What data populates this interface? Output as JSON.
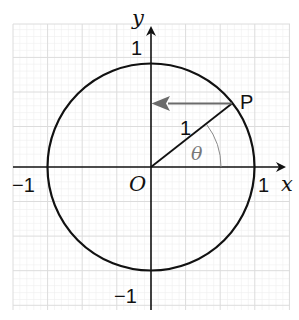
{
  "figure": {
    "axes": {
      "x_label": "x",
      "y_label": "y",
      "origin_label": "O",
      "tick_labels": {
        "x_neg": "−1",
        "x_pos": "1",
        "y_pos": "1",
        "y_neg": "−1"
      }
    },
    "point": {
      "label": "P"
    },
    "radius_label": "1",
    "angle_label": "θ",
    "colors": {
      "grid": "#e3e3e3",
      "axes": "#111111",
      "circle": "#111111",
      "arrow": "#6b6b6b",
      "angle_arc": "#8a8a8a"
    }
  }
}
